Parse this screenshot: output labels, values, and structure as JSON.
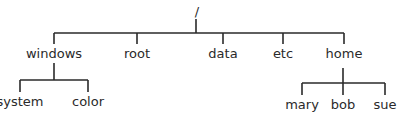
{
  "diagram": {
    "type": "tree",
    "title": "",
    "root": {
      "label": "/",
      "children": [
        {
          "label": "windows",
          "children": [
            {
              "label": "system"
            },
            {
              "label": "color"
            }
          ]
        },
        {
          "label": "root"
        },
        {
          "label": "data"
        },
        {
          "label": "etc"
        },
        {
          "label": "home",
          "children": [
            {
              "label": "mary"
            },
            {
              "label": "bob"
            },
            {
              "label": "sue"
            }
          ]
        }
      ]
    }
  },
  "nodes": {
    "root": "/",
    "windows": "windows",
    "rootdir": "root",
    "data": "data",
    "etc": "etc",
    "home": "home",
    "system": "system",
    "color": "color",
    "mary": "mary",
    "bob": "bob",
    "sue": "sue"
  },
  "colors": {
    "line": "#2a2a2a",
    "text": "#2a2a2a",
    "background": "#ffffff"
  }
}
